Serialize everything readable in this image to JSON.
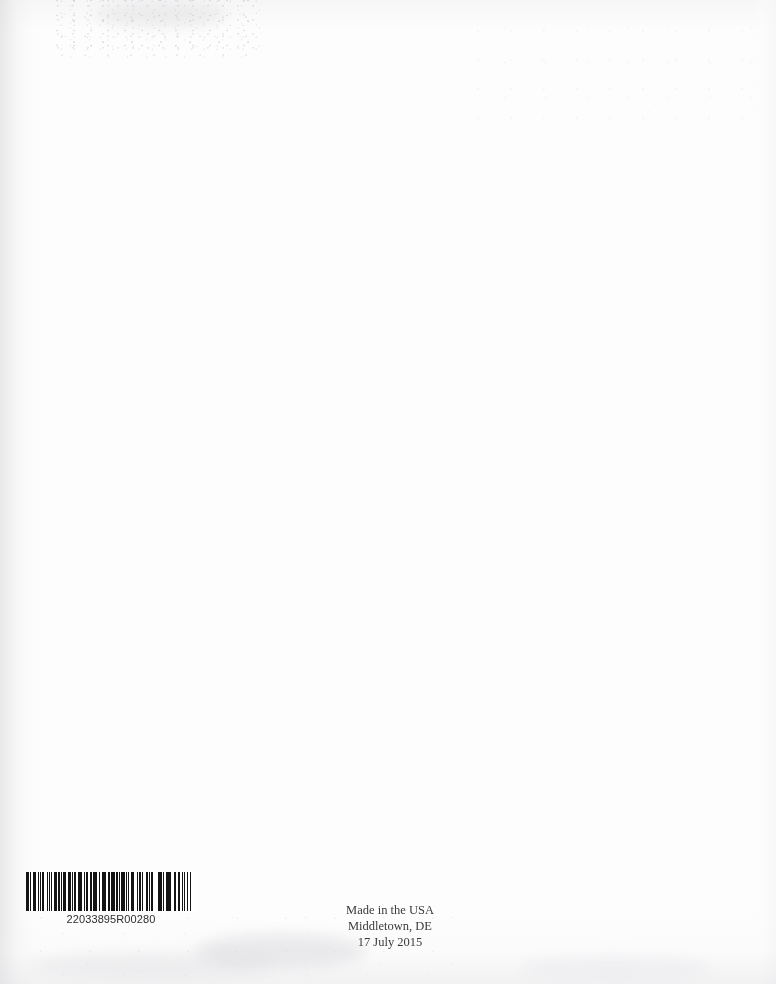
{
  "page": {
    "kind": "scanned-book-back-cover",
    "width": 776,
    "height": 984,
    "background_color": "#fdfdfd",
    "ink_color": "#3b3b3b"
  },
  "barcode": {
    "name": "print-on-demand-barcode",
    "symbology": "Code 128",
    "human_readable_text": "22033895R00280",
    "bar_color": "#141414",
    "background_color": "#ffffff",
    "modules": [
      3,
      1,
      1,
      2,
      3,
      1,
      1,
      1,
      2,
      1,
      3,
      2,
      1,
      1,
      2,
      2,
      1,
      3,
      1,
      1,
      2,
      1,
      1,
      4,
      1,
      2,
      2,
      1,
      3,
      1,
      1,
      2,
      1,
      1,
      3,
      3,
      1,
      1,
      2,
      1,
      2,
      1,
      4,
      1,
      1,
      2,
      1,
      2,
      3,
      1,
      1,
      3,
      1,
      2,
      1,
      1,
      2,
      3,
      2,
      1,
      1,
      1,
      3,
      2,
      1,
      2,
      1,
      1,
      4,
      2,
      1,
      1,
      2,
      1,
      2,
      2,
      3,
      1,
      1,
      1,
      1,
      3,
      2,
      2,
      1,
      1,
      2,
      1,
      3,
      1,
      2,
      1,
      1,
      2,
      2,
      3,
      1,
      1,
      3,
      1,
      1,
      2,
      2,
      1,
      1,
      3,
      1,
      2,
      3,
      1,
      1,
      1,
      2,
      2,
      1,
      3,
      2,
      1,
      1,
      2,
      1,
      1,
      2,
      4,
      1,
      1,
      3,
      1,
      2,
      1,
      1,
      2,
      2,
      2,
      1,
      3,
      1,
      1,
      2,
      1,
      3,
      2,
      1,
      1,
      2,
      3,
      1,
      1,
      1,
      2,
      2,
      1,
      3,
      1,
      1,
      3,
      2,
      1,
      1,
      2,
      1,
      1,
      4,
      1,
      2,
      1,
      1,
      3,
      2,
      1,
      2,
      1,
      1,
      2,
      3,
      1,
      1,
      1,
      2,
      3,
      1,
      2,
      1,
      1,
      2,
      2,
      1,
      1,
      3,
      2,
      1,
      2
    ]
  },
  "imprint": {
    "name": "print-location-imprint",
    "lines": [
      "Made in the USA",
      "Middletown, DE",
      "17 July 2015"
    ],
    "line_made_in": "Made in the USA",
    "line_city": "Middletown, DE",
    "line_date": "17 July 2015"
  }
}
